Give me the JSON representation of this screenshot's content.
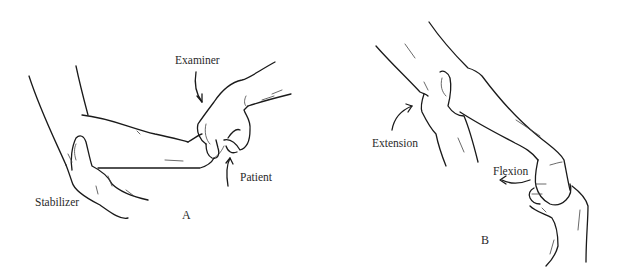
{
  "figure": {
    "panels": [
      {
        "id": "A",
        "letter": "A",
        "labels": {
          "examiner": "Examiner",
          "patient": "Patient",
          "stabilizer": "Stabilizer"
        }
      },
      {
        "id": "B",
        "letter": "B",
        "labels": {
          "extension": "Extension",
          "flexion": "Flexion"
        }
      }
    ]
  }
}
